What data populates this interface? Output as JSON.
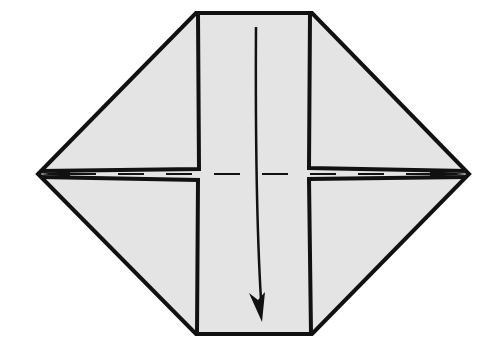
{
  "diagram": {
    "type": "origami-step",
    "colors": {
      "paper": "#e4e4e4",
      "outline": "#111111",
      "background": "#ffffff"
    },
    "fold_line": {
      "style": "dashed",
      "kind": "valley-fold"
    },
    "arrow": {
      "direction": "down",
      "kind": "fold-arrow"
    }
  }
}
